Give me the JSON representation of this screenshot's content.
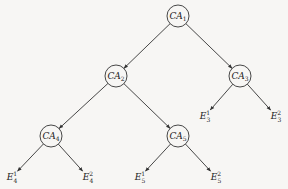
{
  "diagram": {
    "type": "tree",
    "nodes": [
      {
        "id": "CA1",
        "base": "CA",
        "sub": "1",
        "x": 178,
        "y": 16,
        "shape": "circle"
      },
      {
        "id": "CA2",
        "base": "CA",
        "sub": "2",
        "x": 116,
        "y": 76,
        "shape": "circle"
      },
      {
        "id": "CA3",
        "base": "CA",
        "sub": "3",
        "x": 240,
        "y": 76,
        "shape": "circle"
      },
      {
        "id": "CA4",
        "base": "CA",
        "sub": "4",
        "x": 51,
        "y": 136,
        "shape": "circle"
      },
      {
        "id": "CA5",
        "base": "CA",
        "sub": "5",
        "x": 178,
        "y": 136,
        "shape": "circle"
      },
      {
        "id": "E3_1",
        "base": "E",
        "sub": "3",
        "sup": "1",
        "x": 205,
        "y": 116,
        "shape": "text"
      },
      {
        "id": "E3_2",
        "base": "E",
        "sub": "3",
        "sup": "2",
        "x": 276,
        "y": 116,
        "shape": "text"
      },
      {
        "id": "E4_1",
        "base": "E",
        "sub": "4",
        "sup": "1",
        "x": 12,
        "y": 177,
        "shape": "text"
      },
      {
        "id": "E4_2",
        "base": "E",
        "sub": "4",
        "sup": "2",
        "x": 88,
        "y": 177,
        "shape": "text"
      },
      {
        "id": "E5_1",
        "base": "E",
        "sub": "5",
        "sup": "1",
        "x": 140,
        "y": 177,
        "shape": "text"
      },
      {
        "id": "E5_2",
        "base": "E",
        "sub": "5",
        "sup": "2",
        "x": 216,
        "y": 177,
        "shape": "text"
      }
    ],
    "edges": [
      {
        "from": "CA1",
        "to": "CA2"
      },
      {
        "from": "CA1",
        "to": "CA3"
      },
      {
        "from": "CA2",
        "to": "CA4"
      },
      {
        "from": "CA2",
        "to": "CA5"
      },
      {
        "from": "CA3",
        "to": "E3_1"
      },
      {
        "from": "CA3",
        "to": "E3_2"
      },
      {
        "from": "CA4",
        "to": "E4_1"
      },
      {
        "from": "CA4",
        "to": "E4_2"
      },
      {
        "from": "CA5",
        "to": "E5_1"
      },
      {
        "from": "CA5",
        "to": "E5_2"
      }
    ],
    "node_radius": 11
  }
}
